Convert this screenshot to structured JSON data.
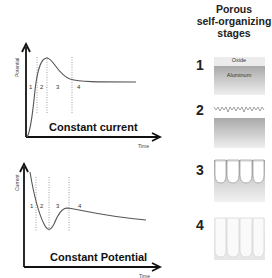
{
  "header": {
    "title_lines": [
      "Porous",
      "self-organizing",
      "stages"
    ]
  },
  "stages": [
    {
      "number": "1",
      "labels": {
        "top": "Oxide",
        "bottom": "Aluminum"
      }
    },
    {
      "number": "2"
    },
    {
      "number": "3"
    },
    {
      "number": "4"
    }
  ],
  "plots": [
    {
      "title": "Constant current",
      "ylabel": "Potential",
      "xlabel": "Time",
      "regions": [
        "1",
        "2",
        "3",
        "4"
      ]
    },
    {
      "title": "Constant Potential",
      "ylabel": "Current",
      "xlabel": "Time",
      "regions": [
        "1",
        "2",
        "3",
        "4"
      ]
    }
  ],
  "colors": {
    "axis": "#111111",
    "curve": "#555555",
    "divider": "#777777",
    "aluminum": "#b8b8b8",
    "oxide": "#e8e8e8"
  }
}
